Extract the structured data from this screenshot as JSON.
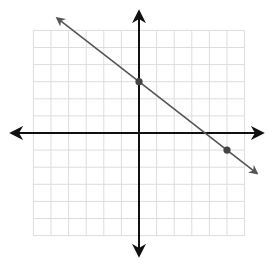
{
  "chart_data": {
    "type": "line",
    "title": "",
    "xlabel": "",
    "ylabel": "",
    "xlim": [
      -6,
      6
    ],
    "ylim": [
      -6,
      6
    ],
    "grid": true,
    "grid_step": 1,
    "tick_labels": false,
    "axes_arrows": true,
    "line": {
      "equation": "y = -0.8x + 3",
      "slope": -0.8,
      "intercept": 3,
      "extends_both_directions": true
    },
    "points": [
      {
        "x": 0,
        "y": 3
      },
      {
        "x": 5,
        "y": -1
      }
    ]
  },
  "colors": {
    "grid": "#dddddd",
    "axis": "#111111",
    "line": "#555555",
    "point": "#444444"
  }
}
